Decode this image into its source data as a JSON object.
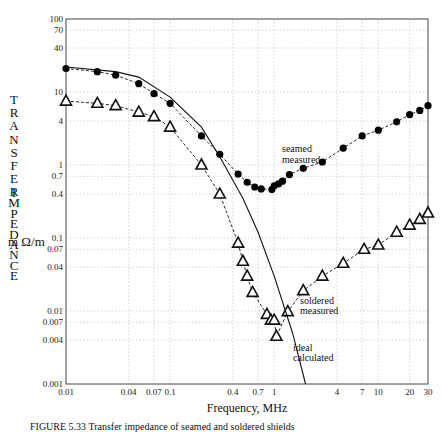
{
  "chart_data": {
    "type": "line",
    "title": "",
    "xlabel": "Frequency, MHz",
    "ylabel": "TRANSFER IMPEDANCE m Ω/m",
    "xscale": "log",
    "yscale": "log",
    "xlim": [
      0.01,
      30
    ],
    "ylim": [
      0.001,
      100
    ],
    "grid": true,
    "x_ticks": [
      0.01,
      0.04,
      0.07,
      0.1,
      0.4,
      0.7,
      1,
      4,
      7,
      10,
      20,
      30
    ],
    "x_tick_labels": [
      "0.01",
      "0.04",
      "0.07",
      "0.1",
      "0.4",
      "0.7",
      "1",
      "4",
      "7",
      "10",
      "20",
      "30"
    ],
    "y_ticks": [
      0.001,
      0.004,
      0.007,
      0.01,
      0.04,
      0.07,
      0.1,
      0.4,
      0.7,
      1,
      4,
      10,
      40,
      70,
      100
    ],
    "y_tick_labels": [
      "0.001",
      "0.004",
      "0.007",
      "0.01",
      "0.04",
      "0.07",
      "0.1",
      "0.4",
      "0.7",
      "1",
      "4",
      "10",
      "40",
      "70",
      "100"
    ],
    "series": [
      {
        "name": "seamed measured",
        "marker": "filled-circle",
        "line": "dashed",
        "x": [
          0.01,
          0.02,
          0.03,
          0.05,
          0.07,
          0.1,
          0.2,
          0.3,
          0.45,
          0.55,
          0.65,
          0.75,
          0.95,
          1.0,
          1.1,
          1.2,
          1.4,
          1.9,
          2.9,
          4.6,
          7.0,
          10,
          15,
          20,
          25,
          30
        ],
        "y": [
          21,
          19,
          17,
          13,
          9.5,
          7,
          2.5,
          1.4,
          0.75,
          0.58,
          0.5,
          0.47,
          0.46,
          0.52,
          0.55,
          0.6,
          0.74,
          0.9,
          1.1,
          1.7,
          2.5,
          3.0,
          3.9,
          4.9,
          5.6,
          6.5
        ],
        "label_text": [
          "seamed",
          "measured"
        ]
      },
      {
        "name": "soldered measured",
        "marker": "open-triangle",
        "line": "dashed",
        "x": [
          0.01,
          0.02,
          0.03,
          0.05,
          0.07,
          0.1,
          0.2,
          0.3,
          0.45,
          0.5,
          0.55,
          0.62,
          0.85,
          0.93,
          1.0,
          1.05,
          1.35,
          1.9,
          2.9,
          4.6,
          7.3,
          10,
          15,
          20,
          25,
          30
        ],
        "y": [
          7.5,
          7.0,
          6.5,
          5.3,
          4.6,
          3.3,
          1.0,
          0.4,
          0.085,
          0.048,
          0.03,
          0.018,
          0.009,
          0.0075,
          0.0075,
          0.0045,
          0.0098,
          0.019,
          0.03,
          0.045,
          0.07,
          0.08,
          0.12,
          0.15,
          0.18,
          0.22
        ],
        "label_text": [
          "soldered",
          "measured"
        ]
      },
      {
        "name": "ideal calculated",
        "marker": "none",
        "line": "solid",
        "x": [
          0.01,
          0.03,
          0.05,
          0.1,
          0.2,
          0.3,
          0.5,
          0.7,
          1.0,
          1.5,
          2.0
        ],
        "y": [
          22,
          19,
          16,
          8.5,
          3.3,
          1.3,
          0.35,
          0.12,
          0.03,
          0.005,
          0.001
        ],
        "label_text": [
          "ideal",
          "calculated"
        ]
      }
    ],
    "annotations": [
      {
        "text": "seamed measured",
        "near_x": 1.5,
        "near_y": 1.5
      },
      {
        "text": "soldered measured",
        "near_x": 1.5,
        "near_y": 0.01
      },
      {
        "text": "ideal calculated",
        "near_x": 1.6,
        "near_y": 0.002
      }
    ]
  },
  "axis": {
    "y_title_letters_1": [
      "T",
      "R",
      "A",
      "N",
      "S",
      "F",
      "E",
      "R"
    ],
    "y_title_letters_2": [
      "I",
      "M",
      "P",
      "E",
      "D",
      "A",
      "N",
      "C",
      "E"
    ],
    "y_unit": "m Ω/m",
    "x_title": "Frequency, MHz"
  },
  "labels": {
    "seamed_1": "seamed",
    "seamed_2": "measured",
    "soldered_1": "soldered",
    "soldered_2": "measured",
    "ideal_1": "ideal",
    "ideal_2": "calculated"
  },
  "caption": "FIGURE 5.33   Transfer impedance of seamed and soldered shields"
}
